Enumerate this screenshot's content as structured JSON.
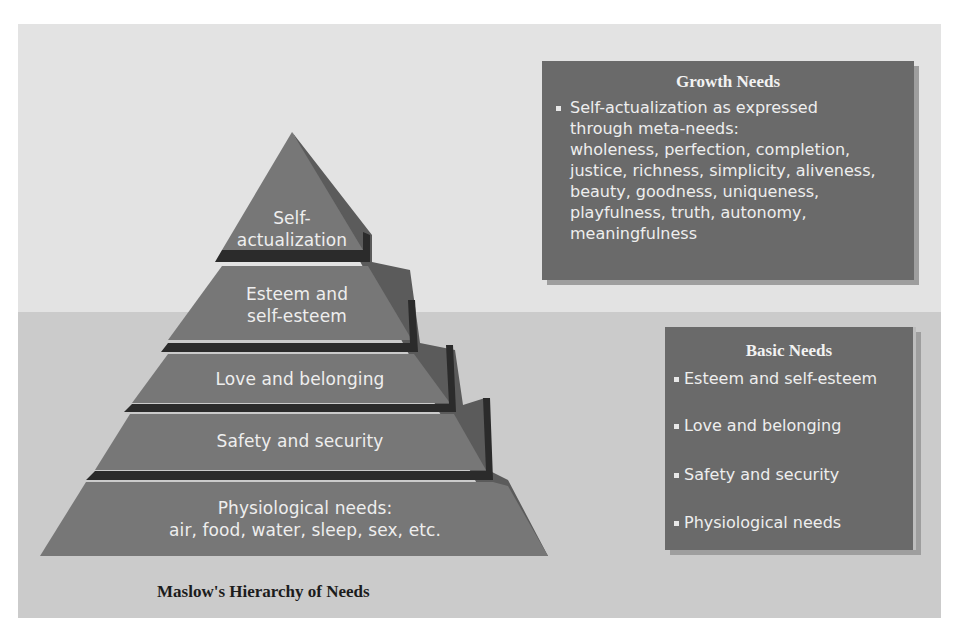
{
  "diagram": {
    "title": "Maslow's Hierarchy of Needs",
    "pyramid": {
      "tiers": [
        {
          "level": 5,
          "line1": "Self-",
          "line2": "actualization"
        },
        {
          "level": 4,
          "line1": "Esteem and",
          "line2": "self-esteem"
        },
        {
          "level": 3,
          "line1": "Love and belonging"
        },
        {
          "level": 2,
          "line1": "Safety and security"
        },
        {
          "level": 1,
          "line1": "Physiological needs:",
          "line2": "air, food, water, sleep, sex, etc."
        }
      ]
    },
    "growth_needs": {
      "heading": "Growth Needs",
      "lines": [
        "Self-actualization as expressed",
        "through meta-needs:",
        "wholeness, perfection, completion,",
        "justice, richness, simplicity, aliveness,",
        "beauty, goodness, uniqueness,",
        "playfulness, truth, autonomy,",
        "meaningfulness"
      ]
    },
    "basic_needs": {
      "heading": "Basic Needs",
      "items": [
        "Esteem and self-esteem",
        "Love and belonging",
        "Safety and security",
        "Physiological needs"
      ]
    },
    "colors": {
      "background_upper": "#e3e3e3",
      "background_lower": "#cbcbcb",
      "pyramid_face": "#777777",
      "pyramid_side": "#5c5c5c",
      "tier_divider": "#2a2a2a",
      "box_fill": "#6a6a6a",
      "text_light": "#eeeeee"
    }
  }
}
